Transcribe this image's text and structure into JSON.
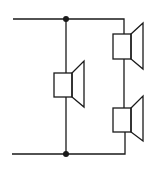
{
  "diagram": {
    "type": "circuit-schematic",
    "colors": {
      "line": "#1a1a1a",
      "background": "#ffffff"
    },
    "nodes": [
      {
        "id": "junction-top",
        "x": 66,
        "y": 19
      },
      {
        "id": "junction-bottom",
        "x": 66,
        "y": 154
      }
    ],
    "components": [
      {
        "id": "speaker-center",
        "label": "",
        "box": {
          "x": 54,
          "y": 73,
          "w": 18,
          "h": 24
        }
      },
      {
        "id": "speaker-top-right",
        "label": "",
        "box": {
          "x": 113,
          "y": 34,
          "w": 18,
          "h": 25
        }
      },
      {
        "id": "speaker-bottom-right",
        "label": "",
        "box": {
          "x": 113,
          "y": 108,
          "w": 18,
          "h": 24
        }
      }
    ]
  }
}
